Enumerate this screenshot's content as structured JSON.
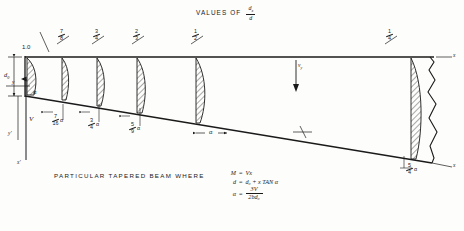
{
  "title": {
    "prefix": "VALUES OF",
    "frac_num": "d",
    "frac_num_sub": "x",
    "frac_den": "d"
  },
  "axes": {
    "x_label": "x",
    "y_label": "y",
    "y_prime_label": "y'",
    "x_prime_label": "x'"
  },
  "top_labels": [
    {
      "value": "1.0",
      "kind": "decimal",
      "x": 28
    },
    {
      "num": "7",
      "den": "8",
      "kind": "fraction",
      "x": 62
    },
    {
      "num": "3",
      "den": "4",
      "kind": "fraction",
      "x": 97
    },
    {
      "num": "2",
      "den": "3",
      "kind": "fraction",
      "x": 137
    },
    {
      "num": "1",
      "den": "2",
      "kind": "fraction",
      "x": 196
    },
    {
      "num": "1",
      "den": "4",
      "kind": "fraction",
      "x": 390
    }
  ],
  "bottom_labels": [
    {
      "num": "7",
      "den": "16",
      "suffix": "α",
      "x": 56
    },
    {
      "num": "3",
      "den": "4",
      "suffix": "α",
      "x": 92
    },
    {
      "num": "5",
      "den": "9",
      "suffix": "α",
      "x": 133
    },
    {
      "plain": "α",
      "x": 211
    },
    {
      "num": "5",
      "den": "4",
      "suffix": "α",
      "x": 410
    }
  ],
  "dimensions": {
    "depth_label": "d",
    "depth_sub": "0",
    "shear_label": "V",
    "alpha_label": "α"
  },
  "caption": "PARTICULAR  TAPERED  BEAM  WHERE",
  "equations": [
    {
      "lhs": "M",
      "rel": "=",
      "rhs": "Vx"
    },
    {
      "lhs": "d",
      "rel": "=",
      "rhs": "d₀ + x TAN α"
    },
    {
      "lhs": "α",
      "rel": "=",
      "num": "3V",
      "den": "2bd₀"
    }
  ],
  "colors": {
    "ink": "#1a1a1a",
    "paper": "#fdfdfc",
    "hatch": "#2a2a2a"
  },
  "stress_profiles": [
    {
      "x": 33,
      "top": 57,
      "bottom": 96,
      "bulge": 9
    },
    {
      "x": 66,
      "top": 57,
      "bottom": 101,
      "bulge": 8
    },
    {
      "x": 101,
      "top": 57,
      "bottom": 107,
      "bulge": 8
    },
    {
      "x": 142,
      "top": 57,
      "bottom": 114,
      "bulge": 9
    },
    {
      "x": 200,
      "top": 57,
      "bottom": 124,
      "bulge": 9
    },
    {
      "x": 415,
      "top": 57,
      "bottom": 160,
      "bulge": 12
    }
  ]
}
